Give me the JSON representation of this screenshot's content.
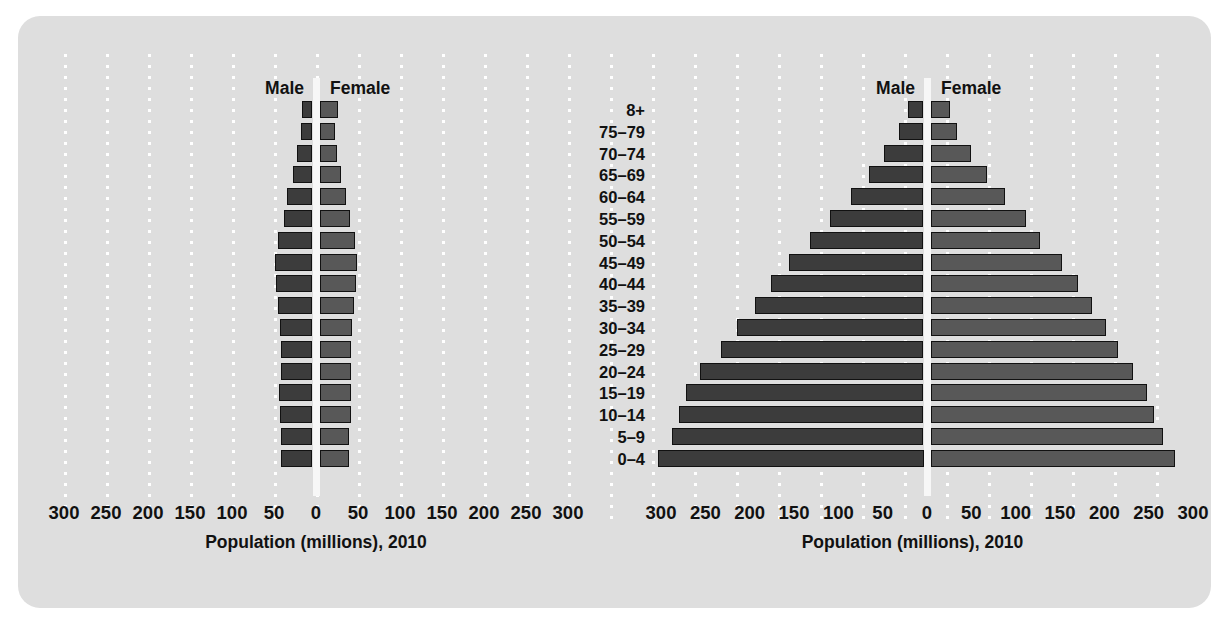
{
  "figure": {
    "panel_bg": "#dedede",
    "male_color": "#3c3c3c",
    "female_color": "#585858",
    "gridline_color": "#ffffff",
    "bar_outline": "#111111"
  },
  "labels": {
    "male": "Male",
    "female": "Female",
    "axis_title": "Population (millions), 2010"
  },
  "age_groups": [
    "8+",
    "75–79",
    "70–74",
    "65–69",
    "60–64",
    "55–59",
    "50–54",
    "45–49",
    "40–44",
    "35–39",
    "30–34",
    "25–29",
    "20–24",
    "15–19",
    "10–14",
    "5–9",
    "0–4"
  ],
  "axis_ticks": [
    300,
    250,
    200,
    150,
    100,
    50,
    0,
    50,
    100,
    150,
    200,
    250,
    300
  ],
  "chart_data": [
    {
      "id": "left",
      "type": "bar",
      "orientation": "population-pyramid",
      "title": "",
      "xlabel": "Population (millions), 2010",
      "ylabel": "",
      "xlim": [
        -300,
        300
      ],
      "xticks": [
        300,
        250,
        200,
        150,
        100,
        50,
        0,
        50,
        100,
        150,
        200,
        250,
        300
      ],
      "grid": true,
      "legend": [
        "Male",
        "Female"
      ],
      "legend_position": "top-center",
      "categories": [
        "8+",
        "75–79",
        "70–74",
        "65–69",
        "60–64",
        "55–59",
        "50–54",
        "45–49",
        "40–44",
        "35–39",
        "30–34",
        "25–29",
        "20–24",
        "15–19",
        "10–14",
        "5–9",
        "0–4"
      ],
      "series": [
        {
          "name": "Male",
          "values": [
            12,
            14,
            19,
            23,
            30,
            34,
            41,
            45,
            43,
            41,
            39,
            38,
            38,
            40,
            39,
            37,
            37
          ]
        },
        {
          "name": "Female",
          "values": [
            22,
            18,
            21,
            25,
            32,
            36,
            42,
            45,
            43,
            41,
            39,
            37,
            37,
            38,
            37,
            35,
            35
          ]
        }
      ]
    },
    {
      "id": "right",
      "type": "bar",
      "orientation": "population-pyramid",
      "title": "",
      "xlabel": "Population (millions), 2010",
      "ylabel": "",
      "xlim": [
        -300,
        300
      ],
      "xticks": [
        300,
        250,
        200,
        150,
        100,
        50,
        0,
        50,
        100,
        150,
        200,
        250,
        300
      ],
      "grid": true,
      "legend": [
        "Male",
        "Female"
      ],
      "legend_position": "top-center",
      "categories": [
        "8+",
        "75–79",
        "70–74",
        "65–69",
        "60–64",
        "55–59",
        "50–54",
        "45–49",
        "40–44",
        "35–39",
        "30–34",
        "25–29",
        "20–24",
        "15–19",
        "10–14",
        "5–9",
        "0–4"
      ],
      "series": [
        {
          "name": "Male",
          "values": [
            18,
            28,
            45,
            62,
            82,
            105,
            128,
            152,
            172,
            190,
            210,
            228,
            252,
            268,
            276,
            284,
            300
          ]
        },
        {
          "name": "Female",
          "values": [
            22,
            30,
            46,
            64,
            84,
            108,
            124,
            148,
            166,
            182,
            198,
            212,
            228,
            244,
            252,
            262,
            276
          ]
        }
      ]
    }
  ]
}
